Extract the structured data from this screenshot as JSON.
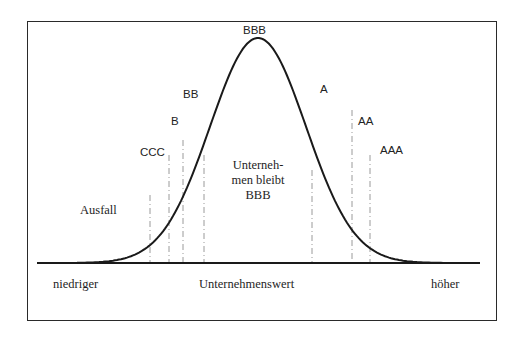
{
  "diagram": {
    "type": "bell-curve-rating-migration",
    "axis": {
      "left_label": "niedriger",
      "center_label": "Unternehmenswert",
      "right_label": "höher"
    },
    "center_annotation": {
      "line1": "Unterneh-",
      "line2": "men bleibt",
      "line3": "BBB"
    },
    "default_label": "Ausfall",
    "ratings": [
      {
        "label": "CCC",
        "x": 140,
        "y": 147
      },
      {
        "label": "B",
        "x": 171,
        "y": 116
      },
      {
        "label": "BB",
        "x": 183,
        "y": 89
      },
      {
        "label": "BBB",
        "x": 243,
        "y": 25
      },
      {
        "label": "A",
        "x": 320,
        "y": 84
      },
      {
        "label": "AA",
        "x": 358,
        "y": 116
      },
      {
        "label": "AAA",
        "x": 380,
        "y": 145
      }
    ],
    "thresholds": [
      {
        "x": 150,
        "top": 195
      },
      {
        "x": 169,
        "top": 155
      },
      {
        "x": 183,
        "top": 140
      },
      {
        "x": 204,
        "top": 155
      },
      {
        "x": 312,
        "top": 170
      },
      {
        "x": 352,
        "top": 110
      },
      {
        "x": 370,
        "top": 155
      }
    ],
    "curve": {
      "mean_x": 258,
      "sigma_px": 48,
      "peak_y": 38,
      "base_y": 263,
      "x_start": 37,
      "x_end": 480
    },
    "colors": {
      "line": "#1a1a1a",
      "dash": "#9a9a9a",
      "frame": "#2a2a2a"
    }
  }
}
